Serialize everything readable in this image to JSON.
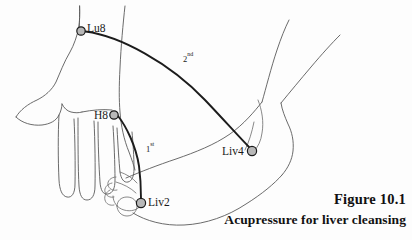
{
  "figure": {
    "caption_title": "Figure 10.1",
    "caption_subtitle": "Acupressure for liver cleansing",
    "background_color": "#fdfdfd",
    "line_color": "#5a5a5a",
    "meridian_color": "#1c1c1c",
    "marker_fill_color": "#b8b8b8",
    "marker_stroke_color": "#1a1a1a",
    "text_color": "#111111"
  },
  "points": [
    {
      "id": "lu8",
      "label": "Lu8",
      "label_x": 87,
      "label_y": 32,
      "marker_x": 81,
      "marker_y": 31,
      "radius": 4.2
    },
    {
      "id": "h8",
      "label": "H8",
      "label_x": 94,
      "label_y": 119,
      "marker_x": 114,
      "marker_y": 115,
      "radius": 4.2
    },
    {
      "id": "liv4",
      "label": "Liv4",
      "label_x": 222,
      "label_y": 155,
      "marker_x": 252,
      "marker_y": 151,
      "radius": 4.6
    },
    {
      "id": "liv2",
      "label": "Liv2",
      "label_x": 148,
      "label_y": 206,
      "marker_x": 141,
      "marker_y": 203,
      "radius": 4.6
    }
  ],
  "sequence_labels": [
    {
      "id": "first",
      "number": "1",
      "ordinal_suffix": "st",
      "x": 146,
      "y": 152
    },
    {
      "id": "second",
      "number": "2",
      "ordinal_suffix": "nd",
      "x": 183,
      "y": 62
    }
  ],
  "meridians": [
    {
      "id": "meridian-2nd",
      "from": "Lu8",
      "to": "Liv4",
      "path": "M 85.5,31.5 C 120,36 170,63 205,100 C 225,121 240,138 249,147"
    },
    {
      "id": "meridian-1st",
      "from": "H8",
      "to": "Liv2",
      "path": "M 118,116 C 126,126 136,146 139,166 C 141,181 141,194 141,198.5"
    }
  ]
}
